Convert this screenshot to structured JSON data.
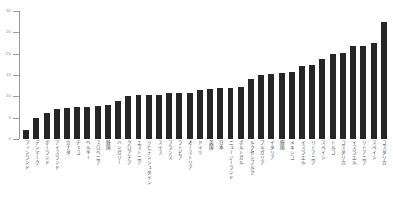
{
  "chart_data": {
    "type": "bar",
    "title": "",
    "subtitle": "",
    "xlabel": "",
    "ylabel": "",
    "ylim": [
      0,
      30
    ],
    "ytick_values": [
      0,
      5,
      10,
      15,
      20,
      25,
      30
    ],
    "ytick_labels": [
      "0",
      "5",
      "10",
      "15",
      "20",
      "25",
      "30"
    ],
    "grid": false,
    "legend": false,
    "bar_color": "#262626",
    "axis_color": "#9a9a9a",
    "categories": [
      "フィンランド",
      "デンマーク",
      "ポーランド",
      "アイスランド",
      "カナダ",
      "チェコ",
      "ベルギー",
      "スロベニア",
      "韓国",
      "ハンガリー",
      "クロアチア",
      "エストニア",
      "リヒテンシュタイン",
      "スイス",
      "フランス",
      "ラトビア",
      "オーストリア",
      "ドイツ",
      "英国",
      "日本",
      "ニュージーランド",
      "ポルトガル",
      "ルクセンブルク",
      "ブルガリア",
      "イタリア",
      "韓国",
      "メキシコ",
      "イスラエル",
      "リトアニア",
      "スペイン",
      "トルコ",
      "コスタリカ"
    ],
    "values": [
      2.0,
      4.9,
      6.0,
      7.1,
      7.3,
      7.4,
      7.6,
      7.8,
      8.0,
      8.8,
      10.0,
      10.3,
      10.3,
      10.4,
      10.7,
      10.7,
      10.7,
      11.5,
      11.8,
      11.9,
      12.0,
      12.1,
      14.1,
      14.9,
      15.2,
      15.4,
      15.6,
      17.1,
      17.3,
      18.7,
      20.0,
      20.1
    ],
    "values_tail": [
      21.8,
      21.9,
      22.4,
      27.5
    ],
    "categories_tail": [
      "イスラエル",
      "リトアニア",
      "スペイン",
      "コスタリカ"
    ]
  }
}
